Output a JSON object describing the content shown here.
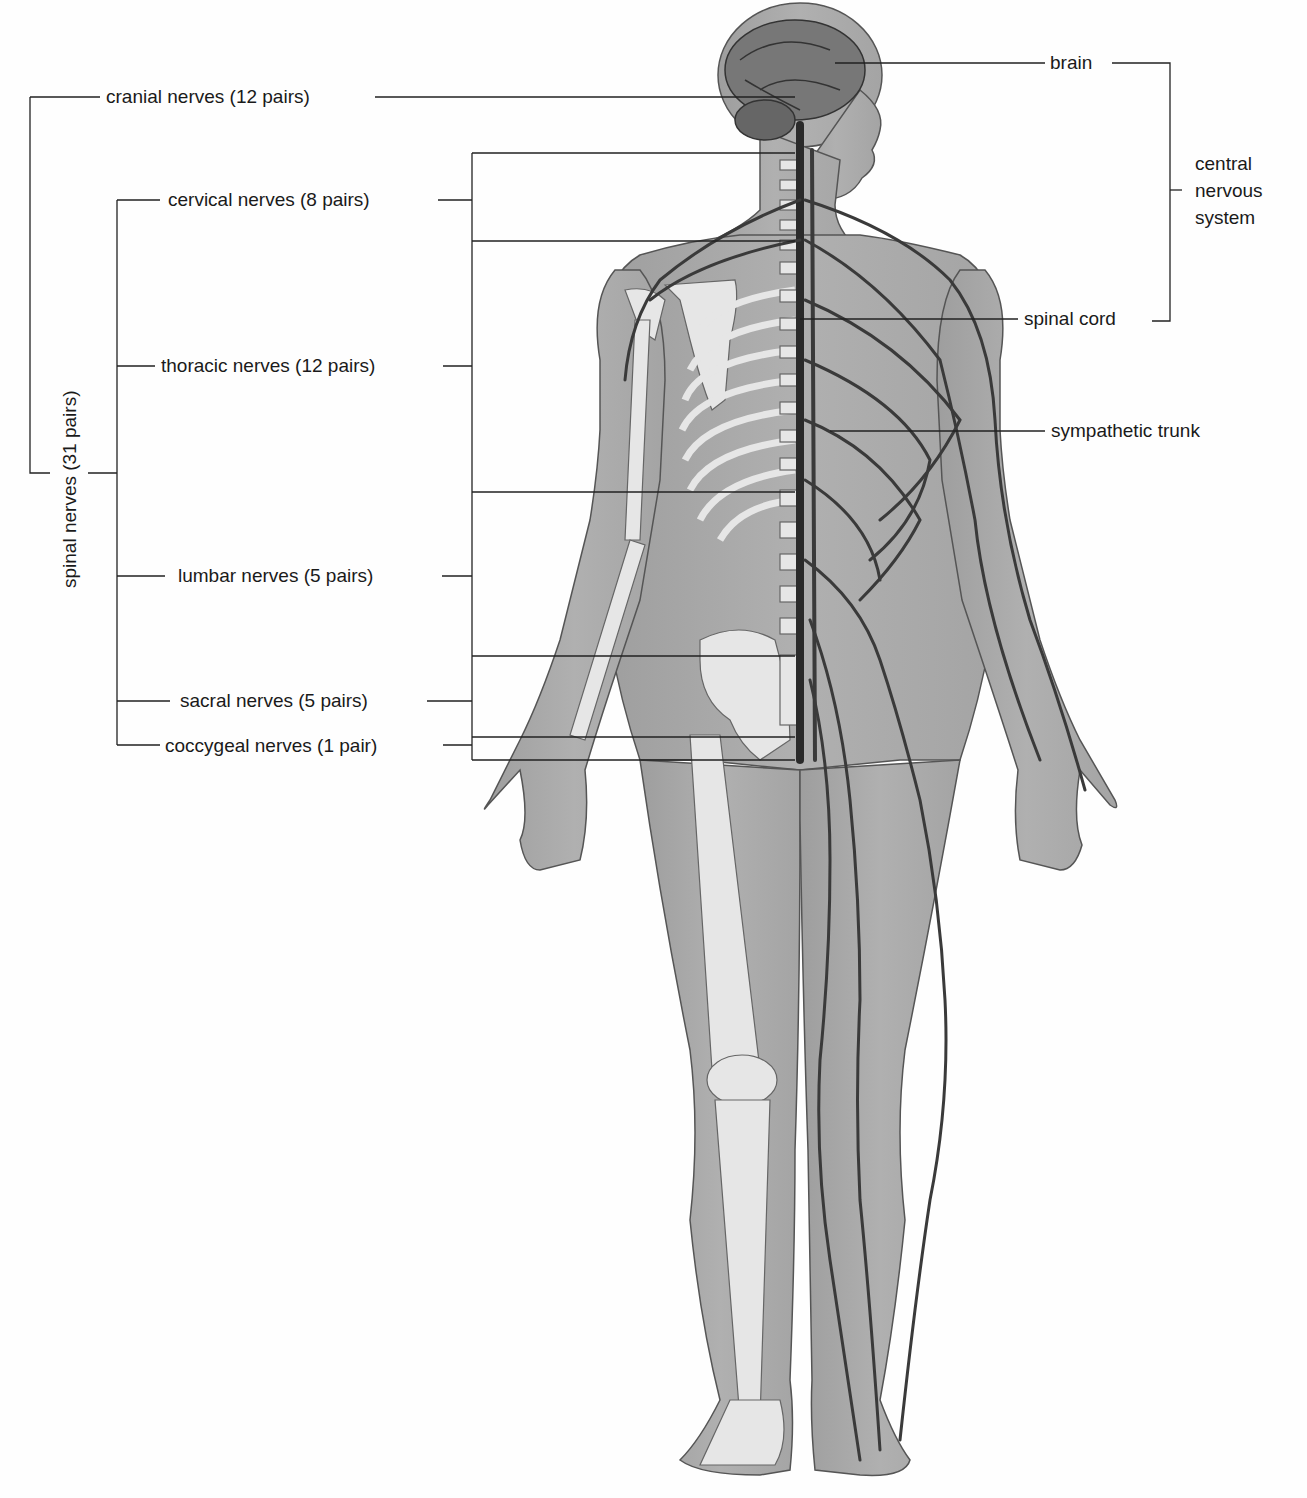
{
  "figure": {
    "colors": {
      "background": "#fefefe",
      "skin": "#a9a9a9",
      "bone": "#e6e6e6",
      "nerve": "#3a3a3a",
      "spinal_cord": "#2a2a2a",
      "leader_line": "#222222"
    }
  },
  "labels": {
    "left": {
      "cranial": "cranial nerves (12 pairs)",
      "spinal_group": "spinal nerves (31 pairs)",
      "cervical": "cervical nerves (8 pairs)",
      "thoracic": "thoracic nerves (12 pairs)",
      "lumbar": "lumbar nerves (5 pairs)",
      "sacral": "sacral nerves (5 pairs)",
      "coccygeal": "coccygeal nerves (1 pair)"
    },
    "right": {
      "brain": "brain",
      "spinal_cord": "spinal cord",
      "cns_group": "central nervous system",
      "sympathetic_trunk": "sympathetic trunk"
    }
  }
}
